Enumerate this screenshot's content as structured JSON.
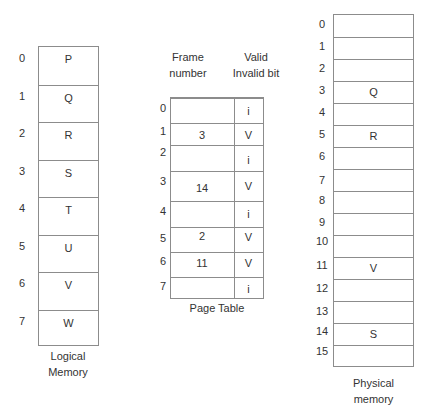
{
  "logical_memory": {
    "label_line1": "Logical",
    "label_line2": "Memory",
    "pages": [
      {
        "index": "0",
        "content": "P"
      },
      {
        "index": "1",
        "content": "Q"
      },
      {
        "index": "2",
        "content": "R"
      },
      {
        "index": "3",
        "content": "S"
      },
      {
        "index": "4",
        "content": "T"
      },
      {
        "index": "5",
        "content": "U"
      },
      {
        "index": "6",
        "content": "V"
      },
      {
        "index": "7",
        "content": "W"
      }
    ]
  },
  "page_table": {
    "label": "Page Table",
    "header_frame_line1": "Frame",
    "header_frame_line2": "number",
    "header_valid_line1": "Valid",
    "header_valid_line2": "Invalid bit",
    "rows": [
      {
        "index": "0",
        "frame": "",
        "bit": "i"
      },
      {
        "index": "1",
        "frame": "3",
        "bit": "V"
      },
      {
        "index": "2",
        "frame": "",
        "bit": "i"
      },
      {
        "index": "3",
        "frame": "14",
        "bit": "V"
      },
      {
        "index": "4",
        "frame": "",
        "bit": "i"
      },
      {
        "index": "5",
        "frame": "2",
        "bit": "V"
      },
      {
        "index": "6",
        "frame": "11",
        "bit": "V"
      },
      {
        "index": "7",
        "frame": "",
        "bit": "i"
      }
    ]
  },
  "physical_memory": {
    "label_line1": "Physical",
    "label_line2": "memory",
    "frames": [
      {
        "index": "0",
        "content": ""
      },
      {
        "index": "1",
        "content": ""
      },
      {
        "index": "2",
        "content": ""
      },
      {
        "index": "3",
        "content": "Q"
      },
      {
        "index": "4",
        "content": ""
      },
      {
        "index": "5",
        "content": "R"
      },
      {
        "index": "6",
        "content": ""
      },
      {
        "index": "7",
        "content": ""
      },
      {
        "index": "8",
        "content": ""
      },
      {
        "index": "9",
        "content": ""
      },
      {
        "index": "10",
        "content": ""
      },
      {
        "index": "11",
        "content": "V"
      },
      {
        "index": "12",
        "content": ""
      },
      {
        "index": "13",
        "content": ""
      },
      {
        "index": "14",
        "content": "S"
      },
      {
        "index": "15",
        "content": ""
      }
    ]
  }
}
